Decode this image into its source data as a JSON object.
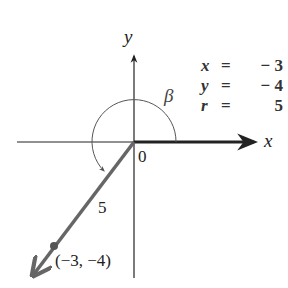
{
  "diagram": {
    "axes": {
      "x_label": "x",
      "y_label": "y",
      "origin_label": "0"
    },
    "angle_label": "β",
    "ray_length_label": "5",
    "point_label": "(−3, −4)",
    "equations": [
      {
        "var": "x",
        "sign": "=",
        "value": "− 3"
      },
      {
        "var": "y",
        "sign": "=",
        "value": "− 4"
      },
      {
        "var": "r",
        "sign": "=",
        "value": "5"
      }
    ],
    "colors": {
      "axis": "#222222",
      "ray": "#666666",
      "arc": "#555555"
    }
  }
}
